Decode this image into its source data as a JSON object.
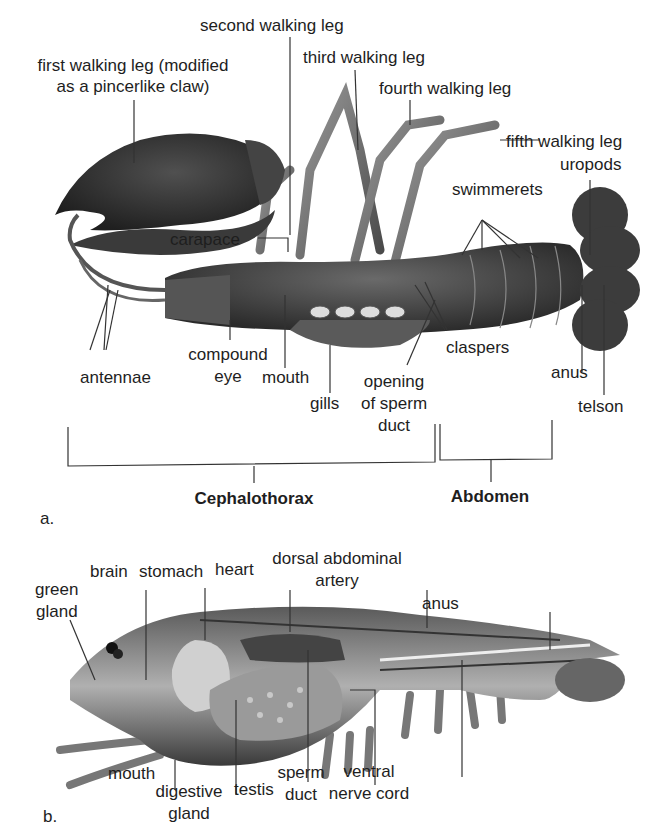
{
  "figure_a": {
    "panel_label": "a.",
    "labels": {
      "first_walking_leg_1": "first walking leg (modified",
      "first_walking_leg_2": "as a pincerlike claw)",
      "second_walking_leg": "second walking leg",
      "third_walking_leg": "third walking leg",
      "fourth_walking_leg": "fourth walking leg",
      "fifth_walking_leg": "fifth walking leg",
      "uropods": "uropods",
      "swimmerets": "swimmerets",
      "carapace": "carapace",
      "compound_eye_1": "compound",
      "compound_eye_2": "eye",
      "antennae": "antennae",
      "mouth": "mouth",
      "gills": "gills",
      "opening_1": "opening",
      "opening_2": "of sperm",
      "opening_3": "duct",
      "claspers": "claspers",
      "anus": "anus",
      "telson": "telson"
    },
    "regions": {
      "cephalothorax": "Cephalothorax",
      "abdomen": "Abdomen"
    }
  },
  "figure_b": {
    "panel_label": "b.",
    "labels": {
      "green_gland_1": "green",
      "green_gland_2": "gland",
      "brain": "brain",
      "stomach": "stomach",
      "heart": "heart",
      "dorsal_artery_1": "dorsal abdominal",
      "dorsal_artery_2": "artery",
      "anus": "anus",
      "mouth": "mouth",
      "digestive_gland_1": "digestive",
      "digestive_gland_2": "gland",
      "testis": "testis",
      "sperm_duct_1": "sperm",
      "sperm_duct_2": "duct",
      "ventral_nerve_1": "ventral",
      "ventral_nerve_2": "nerve cord"
    }
  }
}
